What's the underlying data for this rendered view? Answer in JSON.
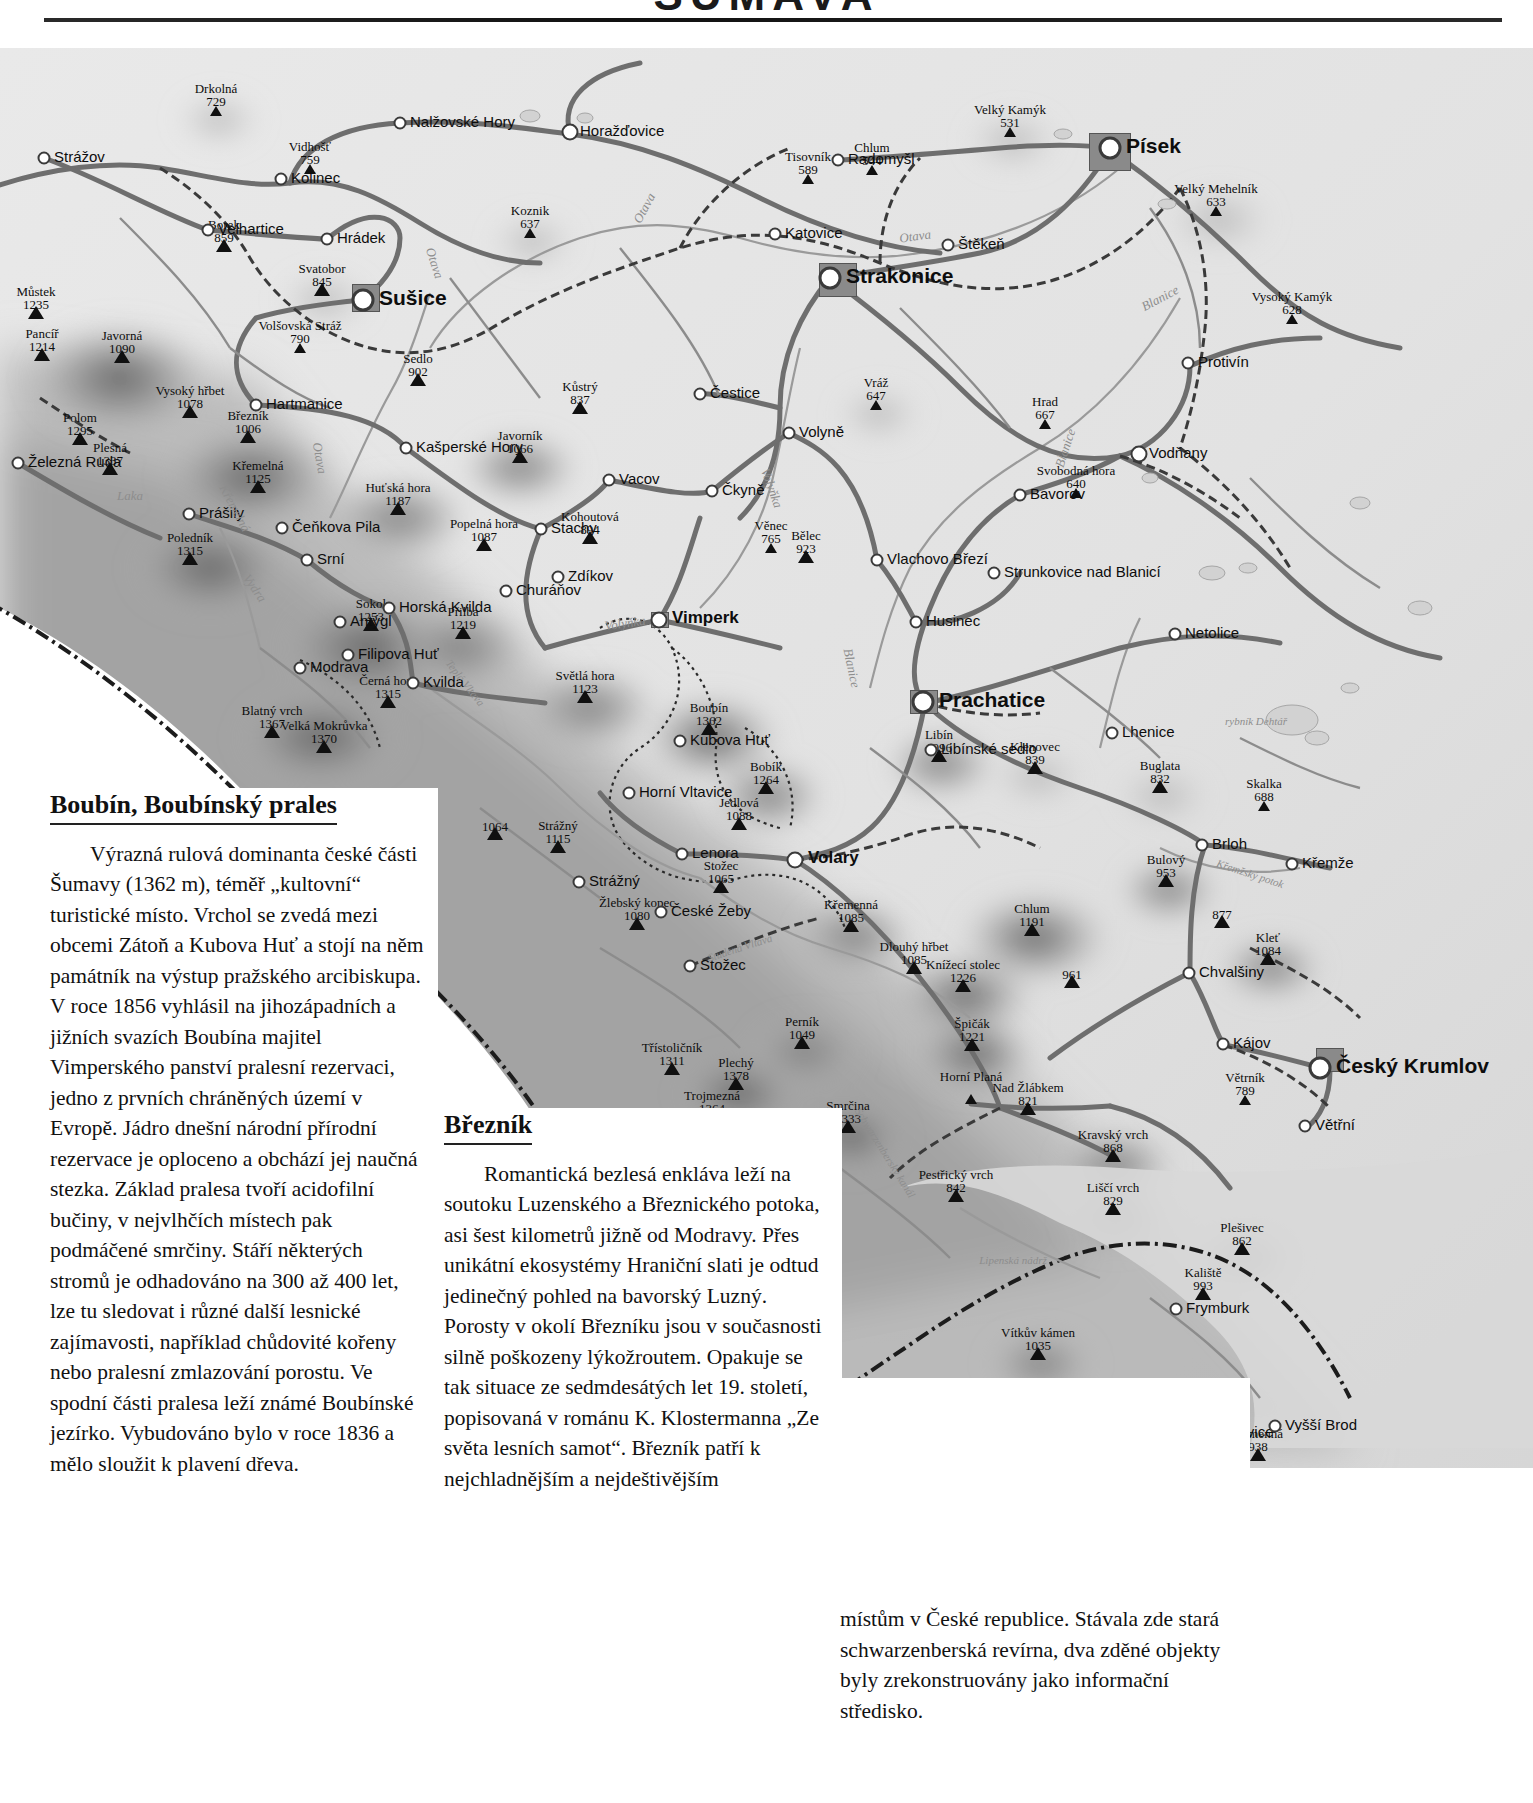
{
  "header": {
    "title": "ŠUMAVA",
    "rule": "horizontal-rule"
  },
  "map": {
    "name": "sumava-relief-map",
    "peaks": [
      {
        "name": "Drkolná",
        "elev": "729",
        "x": 216,
        "y": 68
      },
      {
        "name": "Vidhošť",
        "elev": "759",
        "x": 310,
        "y": 126
      },
      {
        "name": "Borek",
        "elev": "859",
        "x": 224,
        "y": 204
      },
      {
        "name": "Svatobor",
        "elev": "845",
        "x": 322,
        "y": 248
      },
      {
        "name": "Volšovská Stráž",
        "elev": "790",
        "x": 300,
        "y": 305
      },
      {
        "name": "Můstek",
        "elev": "1235",
        "x": 36,
        "y": 271
      },
      {
        "name": "Pancíř",
        "elev": "1214",
        "x": 42,
        "y": 313
      },
      {
        "name": "Javorná",
        "elev": "1090",
        "x": 122,
        "y": 315
      },
      {
        "name": "Polom",
        "elev": "1295",
        "x": 80,
        "y": 397
      },
      {
        "name": "Plesná",
        "elev": "1337",
        "x": 110,
        "y": 427
      },
      {
        "name": "Vysoký hřbet",
        "elev": "1078",
        "x": 190,
        "y": 370
      },
      {
        "name": "Březník",
        "elev": "1006",
        "x": 248,
        "y": 395
      },
      {
        "name": "Křemelná",
        "elev": "1125",
        "x": 258,
        "y": 445
      },
      {
        "name": "Sedlo",
        "elev": "902",
        "x": 418,
        "y": 338
      },
      {
        "name": "Koznik",
        "elev": "637",
        "x": 530,
        "y": 190
      },
      {
        "name": "Kůstrý",
        "elev": "837",
        "x": 580,
        "y": 366
      },
      {
        "name": "Javorník",
        "elev": "1066",
        "x": 520,
        "y": 415
      },
      {
        "name": "Huťská hora",
        "elev": "1187",
        "x": 398,
        "y": 467
      },
      {
        "name": "Popelná hora",
        "elev": "1087",
        "x": 484,
        "y": 503
      },
      {
        "name": "Kohoutová",
        "elev": "894",
        "x": 590,
        "y": 496
      },
      {
        "name": "Poledník",
        "elev": "1315",
        "x": 190,
        "y": 517
      },
      {
        "name": "Sokol",
        "elev": "1253",
        "x": 371,
        "y": 583
      },
      {
        "name": "Přilba",
        "elev": "1219",
        "x": 463,
        "y": 591
      },
      {
        "name": "Černá hora",
        "elev": "1315",
        "x": 388,
        "y": 660
      },
      {
        "name": "Blatný vrch",
        "elev": "1367",
        "x": 272,
        "y": 690
      },
      {
        "name": "Velká Mokrůvka",
        "elev": "1370",
        "x": 324,
        "y": 705
      },
      {
        "name": "Věnec",
        "elev": "765",
        "x": 771,
        "y": 505
      },
      {
        "name": "Bělec",
        "elev": "923",
        "x": 806,
        "y": 515
      },
      {
        "name": "Vráž",
        "elev": "647",
        "x": 876,
        "y": 362
      },
      {
        "name": "Tisovník",
        "elev": "589",
        "x": 808,
        "y": 136
      },
      {
        "name": "Chlum",
        "elev": "544",
        "x": 872,
        "y": 127
      },
      {
        "name": "Velký Kamýk",
        "elev": "531",
        "x": 1010,
        "y": 89
      },
      {
        "name": "Velký Mehelník",
        "elev": "633",
        "x": 1216,
        "y": 168
      },
      {
        "name": "Vysoký Kamýk",
        "elev": "628",
        "x": 1292,
        "y": 276
      },
      {
        "name": "Hrad",
        "elev": "667",
        "x": 1045,
        "y": 381
      },
      {
        "name": "Svobodná hora",
        "elev": "640",
        "x": 1076,
        "y": 450
      },
      {
        "name": "Světlá hora",
        "elev": "1123",
        "x": 585,
        "y": 655
      },
      {
        "name": "Boubín",
        "elev": "1362",
        "x": 709,
        "y": 687
      },
      {
        "name": "Bobík",
        "elev": "1264",
        "x": 766,
        "y": 746
      },
      {
        "name": "Jedlová",
        "elev": "1088",
        "x": 739,
        "y": 782
      },
      {
        "name": "",
        "elev": "1064",
        "x": 495,
        "y": 792
      },
      {
        "name": "Strážný",
        "elev": "1115",
        "x": 558,
        "y": 805
      },
      {
        "name": "Stožec",
        "elev": "1065",
        "x": 721,
        "y": 845
      },
      {
        "name": "Žlebský kopec",
        "elev": "1080",
        "x": 637,
        "y": 882
      },
      {
        "name": "Libín",
        "elev": "1096",
        "x": 939,
        "y": 714
      },
      {
        "name": "Klenovec",
        "elev": "839",
        "x": 1035,
        "y": 726
      },
      {
        "name": "Buglata",
        "elev": "832",
        "x": 1160,
        "y": 745
      },
      {
        "name": "Skalka",
        "elev": "688",
        "x": 1264,
        "y": 763
      },
      {
        "name": "Bulový",
        "elev": "953",
        "x": 1166,
        "y": 839
      },
      {
        "name": "",
        "elev": "877",
        "x": 1222,
        "y": 880
      },
      {
        "name": "Kleť",
        "elev": "1084",
        "x": 1268,
        "y": 917
      },
      {
        "name": "Křemenná",
        "elev": "1085",
        "x": 851,
        "y": 884
      },
      {
        "name": "Chlum",
        "elev": "1191",
        "x": 1032,
        "y": 888
      },
      {
        "name": "Dlouhý hřbet",
        "elev": "1085",
        "x": 914,
        "y": 926
      },
      {
        "name": "Knížecí stolec",
        "elev": "1226",
        "x": 963,
        "y": 944
      },
      {
        "name": "",
        "elev": "961",
        "x": 1072,
        "y": 940
      },
      {
        "name": "Špičák",
        "elev": "1221",
        "x": 972,
        "y": 1003
      },
      {
        "name": "Perník",
        "elev": "1049",
        "x": 802,
        "y": 1001
      },
      {
        "name": "Třístoličník",
        "elev": "1311",
        "x": 672,
        "y": 1027
      },
      {
        "name": "Plechý",
        "elev": "1378",
        "x": 736,
        "y": 1042
      },
      {
        "name": "Trojmezná",
        "elev": "1364",
        "x": 712,
        "y": 1075
      },
      {
        "name": "Smrčina",
        "elev": "1333",
        "x": 848,
        "y": 1085
      },
      {
        "name": "Horní Planá",
        "elev": "",
        "x": 971,
        "y": 1056
      },
      {
        "name": "Nad Žlábkem",
        "elev": "821",
        "x": 1028,
        "y": 1067
      },
      {
        "name": "Kravský vrch",
        "elev": "868",
        "x": 1113,
        "y": 1114
      },
      {
        "name": "Pestřický vrch",
        "elev": "842",
        "x": 956,
        "y": 1154
      },
      {
        "name": "Liščí vrch",
        "elev": "829",
        "x": 1113,
        "y": 1167
      },
      {
        "name": "Plešivec",
        "elev": "862",
        "x": 1242,
        "y": 1207
      },
      {
        "name": "Větrník",
        "elev": "789",
        "x": 1245,
        "y": 1057
      },
      {
        "name": "Vítkův kámen",
        "elev": "1035",
        "x": 1038,
        "y": 1312
      },
      {
        "name": "Kaliště",
        "elev": "993",
        "x": 1203,
        "y": 1252
      },
      {
        "name": "Kamenná",
        "elev": "938",
        "x": 1258,
        "y": 1413
      }
    ],
    "towns": [
      {
        "name": "Strážov",
        "x": 44,
        "y": 110,
        "size": "s"
      },
      {
        "name": "Kolinec",
        "x": 281,
        "y": 131,
        "size": "s"
      },
      {
        "name": "Nalžovské Hory",
        "x": 400,
        "y": 75,
        "size": "s"
      },
      {
        "name": "Horažďovice",
        "x": 570,
        "y": 84,
        "size": "m"
      },
      {
        "name": "Radomyšl",
        "x": 838,
        "y": 112,
        "size": "s"
      },
      {
        "name": "Písek",
        "x": 1110,
        "y": 100,
        "size": "city"
      },
      {
        "name": "Štěkeň",
        "x": 948,
        "y": 197,
        "size": "s"
      },
      {
        "name": "Katovice",
        "x": 775,
        "y": 186,
        "size": "s"
      },
      {
        "name": "Strakonice",
        "x": 830,
        "y": 230,
        "size": "city"
      },
      {
        "name": "Velhartice",
        "x": 208,
        "y": 182,
        "size": "s"
      },
      {
        "name": "Hrádek",
        "x": 327,
        "y": 191,
        "size": "s"
      },
      {
        "name": "Sušice",
        "x": 363,
        "y": 252,
        "size": "city"
      },
      {
        "name": "Hartmanice",
        "x": 256,
        "y": 357,
        "size": "s"
      },
      {
        "name": "Kašperské Hory",
        "x": 406,
        "y": 400,
        "size": "s"
      },
      {
        "name": "Čestice",
        "x": 700,
        "y": 346,
        "size": "s"
      },
      {
        "name": "Volyně",
        "x": 789,
        "y": 385,
        "size": "s"
      },
      {
        "name": "Protivín",
        "x": 1188,
        "y": 315,
        "size": "s"
      },
      {
        "name": "Vodňany",
        "x": 1139,
        "y": 406,
        "size": "m"
      },
      {
        "name": "Bavorov",
        "x": 1020,
        "y": 447,
        "size": "s"
      },
      {
        "name": "Vacov",
        "x": 609,
        "y": 432,
        "size": "s"
      },
      {
        "name": "Čkyně",
        "x": 712,
        "y": 443,
        "size": "s"
      },
      {
        "name": "Stachy",
        "x": 541,
        "y": 481,
        "size": "s"
      },
      {
        "name": "Zdíkov",
        "x": 558,
        "y": 529,
        "size": "s"
      },
      {
        "name": "Vlachovo Březí",
        "x": 877,
        "y": 512,
        "size": "s"
      },
      {
        "name": "Strunkovice nad Blanicí",
        "x": 994,
        "y": 525,
        "size": "s"
      },
      {
        "name": "Husinec",
        "x": 916,
        "y": 574,
        "size": "s"
      },
      {
        "name": "Netolice",
        "x": 1175,
        "y": 586,
        "size": "s"
      },
      {
        "name": "Prachatice",
        "x": 923,
        "y": 654,
        "size": "city"
      },
      {
        "name": "Lhenice",
        "x": 1112,
        "y": 685,
        "size": "s"
      },
      {
        "name": "Libínské sedlo",
        "x": 931,
        "y": 702,
        "size": "s"
      },
      {
        "name": "Brloh",
        "x": 1202,
        "y": 797,
        "size": "s"
      },
      {
        "name": "Křemže",
        "x": 1292,
        "y": 816,
        "size": "s"
      },
      {
        "name": "Chvalšiny",
        "x": 1189,
        "y": 925,
        "size": "s"
      },
      {
        "name": "Kájov",
        "x": 1223,
        "y": 996,
        "size": "s"
      },
      {
        "name": "Český Krumlov",
        "x": 1320,
        "y": 1020,
        "size": "city"
      },
      {
        "name": "Větřní",
        "x": 1305,
        "y": 1078,
        "size": "s"
      },
      {
        "name": "Prášily",
        "x": 189,
        "y": 466,
        "size": "s"
      },
      {
        "name": "Čeňkova Pila",
        "x": 282,
        "y": 480,
        "size": "s"
      },
      {
        "name": "Srní",
        "x": 307,
        "y": 512,
        "size": "s"
      },
      {
        "name": "Horská Kvilda",
        "x": 389,
        "y": 560,
        "size": "s"
      },
      {
        "name": "Churáňov",
        "x": 506,
        "y": 543,
        "size": "s"
      },
      {
        "name": "Antýgl",
        "x": 340,
        "y": 574,
        "size": "s"
      },
      {
        "name": "Filipova Huť",
        "x": 348,
        "y": 607,
        "size": "s"
      },
      {
        "name": "Kvilda",
        "x": 413,
        "y": 635,
        "size": "s"
      },
      {
        "name": "Modrava",
        "x": 300,
        "y": 620,
        "size": "s"
      },
      {
        "name": "Vimperk",
        "x": 659,
        "y": 572,
        "size": "mid"
      },
      {
        "name": "Kubova Huť",
        "x": 680,
        "y": 693,
        "size": "s"
      },
      {
        "name": "Horní Vltavice",
        "x": 629,
        "y": 745,
        "size": "s"
      },
      {
        "name": "Lenora",
        "x": 682,
        "y": 806,
        "size": "s"
      },
      {
        "name": "Volary",
        "x": 795,
        "y": 812,
        "size": "mid"
      },
      {
        "name": "Strážný",
        "x": 579,
        "y": 834,
        "size": "s"
      },
      {
        "name": "České Žeby",
        "x": 661,
        "y": 864,
        "size": "s"
      },
      {
        "name": "Stožec",
        "x": 690,
        "y": 918,
        "size": "s"
      },
      {
        "name": "Železná Ruda",
        "x": 18,
        "y": 415,
        "size": "s"
      },
      {
        "name": "Frymburk",
        "x": 1176,
        "y": 1261,
        "size": "s"
      },
      {
        "name": "Loučovice",
        "x": 1196,
        "y": 1385,
        "size": "s"
      },
      {
        "name": "Vyšší Brod",
        "x": 1275,
        "y": 1378,
        "size": "s"
      }
    ],
    "water_labels": [
      {
        "name": "Otava",
        "x": 644,
        "y": 160,
        "rot": -62
      },
      {
        "name": "Otava",
        "x": 915,
        "y": 188,
        "rot": -8
      },
      {
        "name": "Otava",
        "x": 435,
        "y": 215,
        "rot": 72
      },
      {
        "name": "Otava",
        "x": 320,
        "y": 410,
        "rot": 80
      },
      {
        "name": "Blanice",
        "x": 1160,
        "y": 250,
        "rot": -28
      },
      {
        "name": "Blanice",
        "x": 1065,
        "y": 400,
        "rot": -72
      },
      {
        "name": "Volyňka",
        "x": 772,
        "y": 440,
        "rot": 70
      },
      {
        "name": "Blanice",
        "x": 852,
        "y": 620,
        "rot": 78
      },
      {
        "name": "Volyňka",
        "x": 625,
        "y": 575,
        "rot": -8
      },
      {
        "name": "Křemelná",
        "x": 235,
        "y": 460,
        "rot": 62
      },
      {
        "name": "Vydra",
        "x": 255,
        "y": 540,
        "rot": 55
      },
      {
        "name": "Teplá Vltava",
        "x": 465,
        "y": 635,
        "rot": 52
      },
      {
        "name": "Studená Vltava",
        "x": 740,
        "y": 900,
        "rot": -18
      },
      {
        "name": "Schwarzenberský kanál",
        "x": 885,
        "y": 1105,
        "rot": 58
      },
      {
        "name": "Křemžský potok",
        "x": 1250,
        "y": 826,
        "rot": 18
      },
      {
        "name": "rybník Dehtář",
        "x": 1256,
        "y": 673,
        "rot": 0
      },
      {
        "name": "Lipenská nádrž",
        "x": 1013,
        "y": 1212,
        "rot": 0
      },
      {
        "name": "Laka",
        "x": 130,
        "y": 447,
        "rot": 0
      }
    ]
  },
  "articles": [
    {
      "id": "boubin",
      "title": "Boubín, Boubínský prales",
      "body": "Výrazná rulová dominanta české části Šumavy (1362 m), téměř „kultovní“ turistické místo. Vrchol se zvedá mezi obcemi Zátoň a Kubova Huť a stojí na něm památník na výstup pražského arcibiskupa. V roce 1856 vyhlásil na jihozápadních a jižních svazích Boubína majitel Vimperského panství pralesní rezervaci, jedno z prvních chráněných území v Evropě. Jádro dnešní národní přírodní rezervace je oploceno a obchází jej naučná stezka. Základ pralesa tvoří acidofilní bučiny, v nejvlhčích místech pak podmáčené smrčiny. Stáří některých stromů je odhadováno na 300 až 400 let, lze tu sledovat i různé další lesnické zajímavosti, například chůdovité kořeny nebo pralesní zmlazování porostu. Ve spodní části pralesa leží známé Boubínské jezírko. Vybudováno bylo v roce 1836 a mělo sloužit k plavení dřeva."
    },
    {
      "id": "breznik",
      "title": "Březník",
      "body_col2": "Romantická bezlesá enkláva leží na soutoku Luzenského a Březnického potoka, asi šest kilometrů jižně od Modravy. Přes unikátní ekosystémy Hraniční slati je odtud jedinečný pohled na bavorský Luzný. Porosty v okolí Březníku jsou v současnosti silně poškozeny lýkožroutem. Opakuje se tak situace ze sedmdesátých let 19. století, popisovaná v románu K. Klostermanna „Ze světa lesních samot“. Březník patří k nejchladnějším a nejdeštivějším",
      "body_col3": "místům v České republice. Stávala zde stará schwarzenberská revírna, dva zděné objekty byly zrekonstruovány jako informační středisko."
    }
  ]
}
